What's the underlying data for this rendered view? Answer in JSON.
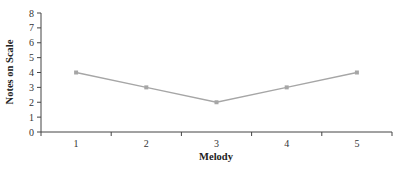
{
  "chart_data": {
    "type": "line",
    "title": "",
    "xlabel": "Melody",
    "ylabel": "Notes on Scale",
    "categories": [
      "1",
      "2",
      "3",
      "4",
      "5"
    ],
    "series": [
      {
        "name": "Notes on Scale",
        "values": [
          4,
          3,
          2,
          3,
          4
        ],
        "color": "#a6a6a6"
      }
    ],
    "ylim": [
      0,
      8
    ],
    "yticks": [
      0,
      1,
      2,
      3,
      4,
      5,
      6,
      7,
      8
    ],
    "grid": false,
    "legend": null
  },
  "colors": {
    "axis": "#444444",
    "line": "#a6a6a6",
    "marker": "#a6a6a6"
  }
}
